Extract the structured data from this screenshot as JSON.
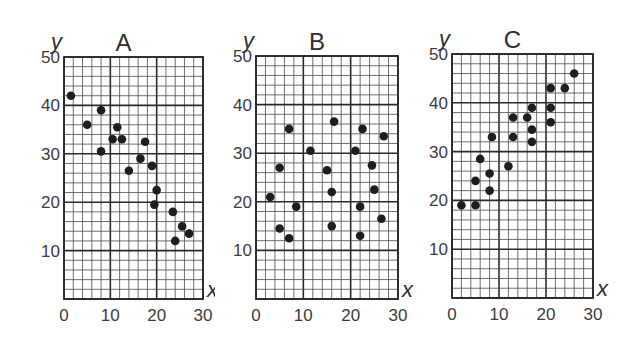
{
  "chart_data": [
    {
      "type": "scatter",
      "title": "A",
      "xlabel": "x",
      "ylabel": "y",
      "xlim": [
        0,
        30
      ],
      "ylim": [
        0,
        50
      ],
      "x_ticks": [
        "0",
        "10",
        "20",
        "30"
      ],
      "y_ticks": [
        "10",
        "20",
        "30",
        "40",
        "50"
      ],
      "grid": true,
      "minor_grid_step": 2,
      "major_grid_step": 10,
      "trend": "negative",
      "points": [
        [
          1.5,
          42
        ],
        [
          5,
          36
        ],
        [
          8,
          39
        ],
        [
          8,
          30.5
        ],
        [
          10.5,
          33
        ],
        [
          11.5,
          35.5
        ],
        [
          12.5,
          33
        ],
        [
          14,
          26.5
        ],
        [
          16.5,
          29
        ],
        [
          17.5,
          32.5
        ],
        [
          19,
          27.5
        ],
        [
          19.5,
          19.5
        ],
        [
          20,
          22.5
        ],
        [
          23.5,
          18
        ],
        [
          24,
          12
        ],
        [
          25.5,
          15
        ],
        [
          27,
          13.5
        ]
      ]
    },
    {
      "type": "scatter",
      "title": "B",
      "xlabel": "x",
      "ylabel": "y",
      "xlim": [
        0,
        30
      ],
      "ylim": [
        0,
        50
      ],
      "x_ticks": [
        "0",
        "10",
        "20",
        "30"
      ],
      "y_ticks": [
        "10",
        "20",
        "30",
        "40",
        "50"
      ],
      "grid": true,
      "minor_grid_step": 2,
      "major_grid_step": 10,
      "trend": "none",
      "points": [
        [
          3,
          21
        ],
        [
          5,
          27
        ],
        [
          5,
          14.5
        ],
        [
          7,
          35
        ],
        [
          7,
          12.5
        ],
        [
          8.5,
          19
        ],
        [
          11.5,
          30.5
        ],
        [
          15,
          26.5
        ],
        [
          16,
          15
        ],
        [
          16,
          22
        ],
        [
          16.5,
          36.5
        ],
        [
          21,
          30.5
        ],
        [
          22,
          19
        ],
        [
          22,
          13
        ],
        [
          22.5,
          35
        ],
        [
          24.5,
          27.5
        ],
        [
          25,
          22.5
        ],
        [
          26.5,
          16.5
        ],
        [
          27,
          33.5
        ]
      ]
    },
    {
      "type": "scatter",
      "title": "C",
      "xlabel": "x",
      "ylabel": "y",
      "xlim": [
        0,
        30
      ],
      "ylim": [
        0,
        50
      ],
      "x_ticks": [
        "0",
        "10",
        "20",
        "30"
      ],
      "y_ticks": [
        "10",
        "20",
        "30",
        "40",
        "50"
      ],
      "grid": true,
      "minor_grid_step": 2,
      "major_grid_step": 10,
      "trend": "positive",
      "points": [
        [
          2,
          19
        ],
        [
          5,
          19
        ],
        [
          5,
          24
        ],
        [
          6,
          28.5
        ],
        [
          8,
          22
        ],
        [
          8,
          25.5
        ],
        [
          8.5,
          33
        ],
        [
          12,
          27
        ],
        [
          13,
          33
        ],
        [
          13,
          37
        ],
        [
          16,
          37
        ],
        [
          17,
          32
        ],
        [
          17,
          34.5
        ],
        [
          17,
          39
        ],
        [
          21,
          36
        ],
        [
          21,
          39
        ],
        [
          21,
          43
        ],
        [
          24,
          43
        ],
        [
          26,
          46
        ]
      ]
    }
  ],
  "style": {
    "background": "#ffffff",
    "grid_minor_color": "#4a4a4a",
    "grid_major_color": "#2a2a2a",
    "point_color": "#1e1e1e",
    "text_color": "#3a3a3a"
  },
  "panels": [
    {
      "title": "A",
      "xlabel": "x",
      "ylabel": "y"
    },
    {
      "title": "B",
      "xlabel": "x",
      "ylabel": "y"
    },
    {
      "title": "C",
      "xlabel": "x",
      "ylabel": "y"
    }
  ]
}
